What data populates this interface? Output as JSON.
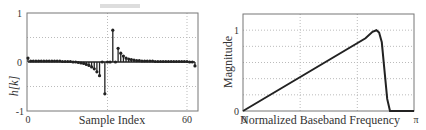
{
  "chart_data": [
    {
      "type": "stem",
      "title": "",
      "xlabel": "Sample Index",
      "ylabel": "h[k]",
      "xlim": [
        0,
        64
      ],
      "ylim": [
        -1,
        1
      ],
      "xticks": [
        "0",
        "60"
      ],
      "yticks": [
        "-1",
        "0",
        "1"
      ],
      "grid": true,
      "x": [
        0,
        1,
        2,
        3,
        4,
        5,
        6,
        7,
        8,
        9,
        10,
        11,
        12,
        13,
        14,
        15,
        16,
        17,
        18,
        19,
        20,
        21,
        22,
        23,
        24,
        25,
        26,
        27,
        28,
        29,
        30,
        31,
        32,
        33,
        34,
        35,
        36,
        37,
        38,
        39,
        40,
        41,
        42,
        43,
        44,
        45,
        46,
        47,
        48,
        49,
        50,
        51,
        52,
        53,
        54,
        55,
        56,
        57,
        58,
        59,
        60,
        61,
        62,
        63
      ],
      "values": [
        0.08,
        0.02,
        0.02,
        0.02,
        0.02,
        0.02,
        0.02,
        0.02,
        0.02,
        0.02,
        0.02,
        0.02,
        0.02,
        0.01,
        0.01,
        0.01,
        0.01,
        0.0,
        0.0,
        -0.01,
        -0.02,
        -0.03,
        -0.05,
        -0.07,
        -0.1,
        -0.14,
        -0.2,
        -0.28,
        0.0,
        -0.65,
        0.0,
        0.0,
        0.65,
        0.0,
        0.28,
        0.18,
        0.12,
        0.08,
        0.06,
        0.05,
        0.04,
        0.03,
        0.03,
        0.02,
        0.02,
        0.02,
        0.02,
        0.02,
        0.01,
        0.01,
        0.01,
        0.01,
        0.01,
        0.01,
        0.01,
        0.01,
        0.01,
        0.01,
        0.01,
        0.01,
        0.01,
        0.0,
        0.0,
        -0.08
      ]
    },
    {
      "type": "line",
      "title": "",
      "xlabel": "Normalized Baseband Frequency",
      "ylabel": "Magnitude",
      "xlim": [
        0,
        3.1416
      ],
      "ylim": [
        0,
        1.2
      ],
      "xticks": [
        "0",
        "π"
      ],
      "yticks": [
        "0",
        "1"
      ],
      "grid": true,
      "x": [
        0,
        2.25,
        2.38,
        2.45,
        2.5,
        2.55,
        2.6,
        2.65,
        2.7,
        2.75,
        3.1416
      ],
      "values": [
        0,
        0.9,
        0.98,
        1.0,
        0.97,
        0.85,
        0.5,
        0.15,
        0.0,
        0.0,
        0.0
      ]
    }
  ],
  "left_plot": {
    "xlabel": "Sample Index",
    "ylabel": "h[k]",
    "xtick_0": "0",
    "xtick_60": "60",
    "ytick_1": "1",
    "ytick_0": "0",
    "ytick_m1": "-1"
  },
  "right_plot": {
    "xlabel": "Normalized Baseband Frequency",
    "ylabel": "Magnitude",
    "xtick_0": "0",
    "xtick_pi": "π",
    "ytick_0": "0",
    "ytick_1": "1"
  }
}
